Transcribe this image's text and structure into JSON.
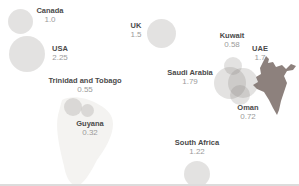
{
  "figure": {
    "background_color": "#ffffff",
    "bubble_fill": "rgba(128,124,119,0.22)",
    "faint_map_fill": "#f4f3f1",
    "india_fill": "#8d817d",
    "label_color": "#4a4a4a",
    "value_color": "#9b9b9b",
    "bottom_border_color": "#dcdcdc"
  },
  "chart_data": {
    "type": "bubble-map",
    "title": "",
    "legend": "none",
    "points": [
      {
        "country": "Canada",
        "value": 1.0,
        "value_display": "1.0",
        "bubble": {
          "x": 20,
          "y": 21,
          "r": 12.5
        },
        "label": {
          "x": 50,
          "y": 6
        }
      },
      {
        "country": "USA",
        "value": 2.25,
        "value_display": "2.25",
        "bubble": {
          "x": 27,
          "y": 54,
          "r": 18
        },
        "label": {
          "x": 60,
          "y": 44
        }
      },
      {
        "country": "UK",
        "value": 1.5,
        "value_display": "1.5",
        "bubble": {
          "x": 161,
          "y": 33,
          "r": 14.5
        },
        "label": {
          "x": 136,
          "y": 21
        }
      },
      {
        "country": "Trinidad and Tobago",
        "value": 0.55,
        "value_display": "0.55",
        "bubble": {
          "x": 73,
          "y": 107,
          "r": 9
        },
        "label": {
          "x": 85,
          "y": 76
        }
      },
      {
        "country": "Guyana",
        "value": 0.32,
        "value_display": "0.32",
        "bubble": {
          "x": 87,
          "y": 110,
          "r": 6.5
        },
        "label": {
          "x": 90,
          "y": 119
        }
      },
      {
        "country": "Kuwait",
        "value": 0.58,
        "value_display": "0.58",
        "bubble": {
          "x": 233,
          "y": 66,
          "r": 9
        },
        "label": {
          "x": 232,
          "y": 31
        }
      },
      {
        "country": "UAE",
        "value": 1.7,
        "value_display": "1.7",
        "bubble": {
          "x": 243,
          "y": 83,
          "r": 15
        },
        "label": {
          "x": 260,
          "y": 44
        }
      },
      {
        "country": "Saudi Arabia",
        "value": 1.79,
        "value_display": "1.79",
        "bubble": {
          "x": 230,
          "y": 83,
          "r": 16
        },
        "label": {
          "x": 190,
          "y": 68
        }
      },
      {
        "country": "Oman",
        "value": 0.72,
        "value_display": "0.72",
        "bubble": {
          "x": 240,
          "y": 95,
          "r": 10
        },
        "label": {
          "x": 248,
          "y": 103
        }
      },
      {
        "country": "South Africa",
        "value": 1.22,
        "value_display": "1.22",
        "bubble": {
          "x": 197,
          "y": 174,
          "r": 13
        },
        "label": {
          "x": 197,
          "y": 138
        }
      }
    ]
  }
}
